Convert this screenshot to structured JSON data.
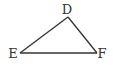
{
  "diagram": {
    "type": "triangle",
    "stroke_color": "#333333",
    "vertices": [
      {
        "label": "D",
        "x": 68,
        "y": 17,
        "label_x": 67,
        "label_y": 14
      },
      {
        "label": "E",
        "x": 20,
        "y": 53,
        "label_x": 13,
        "label_y": 58
      },
      {
        "label": "F",
        "x": 97,
        "y": 53,
        "label_x": 101,
        "label_y": 58
      }
    ],
    "edges": [
      {
        "from": "D",
        "to": "E"
      },
      {
        "from": "E",
        "to": "F"
      },
      {
        "from": "F",
        "to": "D"
      }
    ]
  }
}
